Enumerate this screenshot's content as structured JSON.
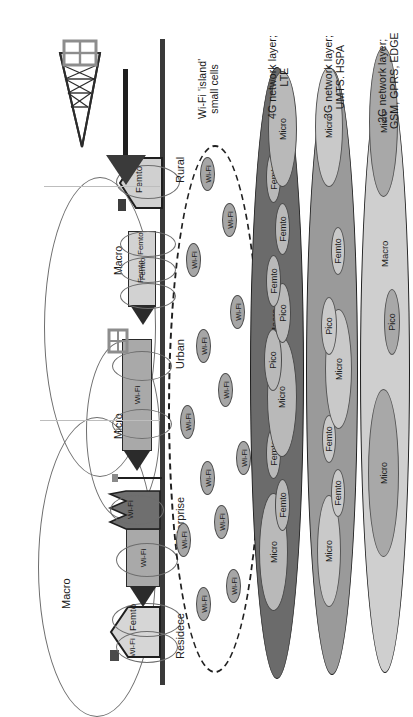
{
  "figure": {
    "orientation": "landscape figure shown rotated 90 degrees counter-clockwise"
  },
  "legend": [
    {
      "id": "wifi",
      "line1": "Wi-Fi 'island'",
      "line2": "small cells"
    },
    {
      "id": "l4g",
      "line1": "4G network layer;",
      "line2": "LTE"
    },
    {
      "id": "l3g",
      "line1": "3G network layer;",
      "line2": "UMTS. HSPA"
    },
    {
      "id": "l2g",
      "line1": "2G network layer;",
      "line2": "GSM, GPRS, EDGE"
    }
  ],
  "environments": [
    {
      "id": "residence",
      "label": "Residece"
    },
    {
      "id": "enterprise",
      "label": "Enterprise"
    },
    {
      "id": "urban",
      "label": "Urban"
    },
    {
      "id": "rural",
      "label": "Rural"
    }
  ],
  "scene": {
    "macro_far_label": "Macro",
    "macro_near_label": "Macro",
    "micro_label": "Micro",
    "house_wifi_label": "Wi-Fi",
    "house_femto_label": "Femto",
    "enterprise_wifi_label": "Wi-Fi",
    "enterprise_building_wifi_label": "Wi-Fi",
    "tower_wifi_label": "Wi-Fi",
    "urban_wifi_label": "Wi-Fi",
    "urban_femto_labels": [
      "Femto",
      "Femto",
      "Femto"
    ],
    "rural_femto_label": "Femto"
  },
  "wifi_island": {
    "dot_label": "Wi-Fi",
    "dots": [
      {
        "x": 86,
        "y": 196
      },
      {
        "x": 104,
        "y": 226
      },
      {
        "x": 150,
        "y": 176
      },
      {
        "x": 168,
        "y": 214
      },
      {
        "x": 212,
        "y": 200
      },
      {
        "x": 232,
        "y": 236
      },
      {
        "x": 268,
        "y": 180
      },
      {
        "x": 300,
        "y": 218
      },
      {
        "x": 344,
        "y": 196
      },
      {
        "x": 378,
        "y": 230
      },
      {
        "x": 430,
        "y": 186
      },
      {
        "x": 470,
        "y": 222
      },
      {
        "x": 516,
        "y": 200
      }
    ]
  },
  "layers": {
    "l4g": {
      "name": "4G network layer; LTE",
      "macro_label": "Macro",
      "cells": [
        {
          "type": "Micro",
          "x": 96,
          "w": 118,
          "h": 86
        },
        {
          "type": "Femto",
          "x": 176,
          "w": 52,
          "h": 44
        },
        {
          "type": "Femto",
          "x": 228,
          "w": 52,
          "h": 44
        },
        {
          "type": "Micro",
          "x": 250,
          "w": 120,
          "h": 88
        },
        {
          "type": "Pico",
          "x": 316,
          "w": 62,
          "h": 52
        },
        {
          "type": "Pico",
          "x": 364,
          "w": 60,
          "h": 50
        },
        {
          "type": "Femto",
          "x": 400,
          "w": 52,
          "h": 44
        },
        {
          "type": "Femto",
          "x": 452,
          "w": 52,
          "h": 44
        },
        {
          "type": "Femto",
          "x": 504,
          "w": 52,
          "h": 44
        },
        {
          "type": "Micro",
          "x": 520,
          "w": 116,
          "h": 84
        }
      ]
    },
    "l3g": {
      "name": "3G network layer; UMTS. HSPA",
      "macro_label": "Macro",
      "cells": [
        {
          "type": "Micro",
          "x": 100,
          "w": 112,
          "h": 72
        },
        {
          "type": "Femto",
          "x": 190,
          "w": 48,
          "h": 40
        },
        {
          "type": "Femto",
          "x": 244,
          "w": 48,
          "h": 40
        },
        {
          "type": "Micro",
          "x": 278,
          "w": 120,
          "h": 80
        },
        {
          "type": "Pico",
          "x": 352,
          "w": 58,
          "h": 48
        },
        {
          "type": "Femto",
          "x": 432,
          "w": 48,
          "h": 40
        },
        {
          "type": "Micro",
          "x": 520,
          "w": 120,
          "h": 82
        }
      ]
    },
    "l2g": {
      "name": "2G network layer; GSM, GPRS, EDGE",
      "macro_label": "Macro",
      "cells": [
        {
          "type": "Micro",
          "x": 150,
          "w": 168,
          "h": 92
        },
        {
          "type": "Pico",
          "x": 352,
          "w": 66,
          "h": 48
        },
        {
          "type": "Micro",
          "x": 510,
          "w": 150,
          "h": 86
        }
      ]
    }
  },
  "colors": {
    "l4g_fill": "#6b6b6b",
    "l4g_inner": "#b9b9b9",
    "l3g_fill": "#9a9a9a",
    "l3g_inner": "#c9c9c9",
    "l2g_fill": "#cfcfcf",
    "l2g_inner": "#a8a8a8",
    "wifi_dot": "#a6a6a6",
    "ground": "#3a3a3a",
    "outline": "#1d1d1d"
  }
}
